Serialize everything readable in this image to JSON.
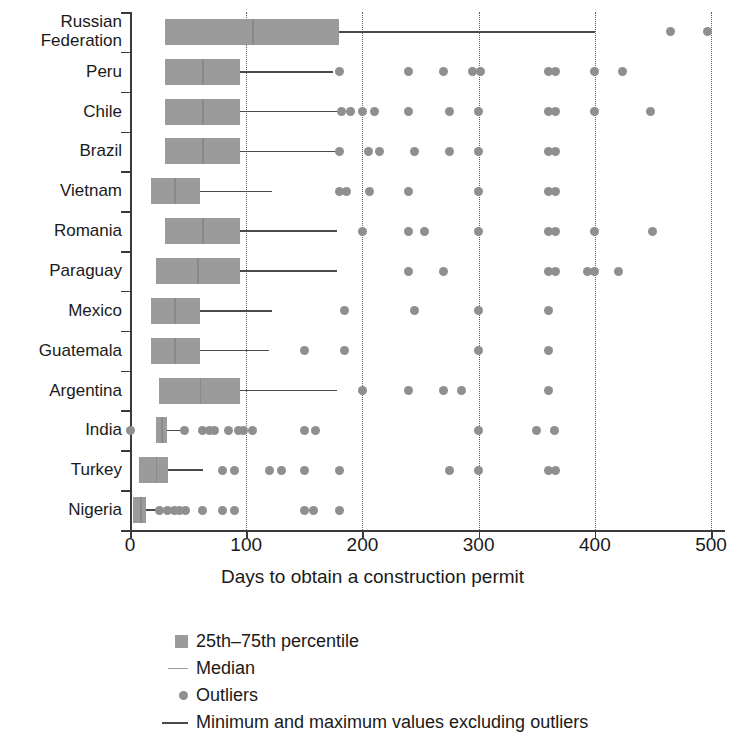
{
  "chart_data": {
    "type": "boxplot",
    "title": "",
    "xlabel": "Days to obtain a construction permit",
    "ylabel": "",
    "xlim": [
      0,
      512
    ],
    "xticks": [
      0,
      100,
      200,
      300,
      400,
      500
    ],
    "xticklabels": [
      "0",
      "100",
      "200",
      "300",
      "400",
      "500"
    ],
    "gridlines_x": [
      100,
      200,
      300,
      400,
      500
    ],
    "grid": "dotted-vertical",
    "orientation": "horizontal",
    "legend_position": "below-axis-left",
    "categories": [
      "Russian\nFederation",
      "Peru",
      "Chile",
      "Brazil",
      "Vietnam",
      "Romania",
      "Paraguay",
      "Mexico",
      "Guatemala",
      "Argentina",
      "India",
      "Turkey",
      "Nigeria"
    ],
    "boxes": [
      {
        "category": "Russian Federation",
        "min": 30,
        "q1": 30,
        "median": 105,
        "q3": 180,
        "max": 400,
        "outliers": [
          465,
          497
        ]
      },
      {
        "category": "Peru",
        "min": 30,
        "q1": 30,
        "median": 62,
        "q3": 95,
        "max": 175,
        "outliers": [
          180,
          240,
          270,
          295,
          302,
          360,
          366,
          400,
          424
        ]
      },
      {
        "category": "Chile",
        "min": 30,
        "q1": 30,
        "median": 62,
        "q3": 95,
        "max": 180,
        "outliers": [
          182,
          190,
          200,
          210,
          240,
          275,
          300,
          360,
          366,
          400,
          448
        ]
      },
      {
        "category": "Brazil",
        "min": 30,
        "q1": 30,
        "median": 62,
        "q3": 95,
        "max": 178,
        "outliers": [
          180,
          205,
          215,
          245,
          275,
          300,
          360,
          366
        ]
      },
      {
        "category": "Vietnam",
        "min": 18,
        "q1": 18,
        "median": 38,
        "q3": 60,
        "max": 122,
        "outliers": [
          180,
          186,
          206,
          240,
          300,
          360,
          366
        ]
      },
      {
        "category": "Romania",
        "min": 30,
        "q1": 30,
        "median": 62,
        "q3": 95,
        "max": 178,
        "outliers": [
          200,
          240,
          253,
          300,
          360,
          366,
          400,
          450
        ]
      },
      {
        "category": "Paraguay",
        "min": 22,
        "q1": 22,
        "median": 58,
        "q3": 95,
        "max": 178,
        "outliers": [
          240,
          270,
          360,
          366,
          394,
          400,
          420
        ]
      },
      {
        "category": "Mexico",
        "min": 18,
        "q1": 18,
        "median": 38,
        "q3": 60,
        "max": 122,
        "outliers": [
          185,
          245,
          300,
          360
        ]
      },
      {
        "category": "Guatemala",
        "min": 18,
        "q1": 18,
        "median": 38,
        "q3": 60,
        "max": 120,
        "outliers": [
          150,
          185,
          300,
          360
        ]
      },
      {
        "category": "Argentina",
        "min": 25,
        "q1": 25,
        "median": 60,
        "q3": 95,
        "max": 178,
        "outliers": [
          200,
          240,
          270,
          285,
          360
        ]
      },
      {
        "category": "India",
        "min": 22,
        "q1": 22,
        "median": 27,
        "q3": 32,
        "max": 48,
        "outliers": [
          0,
          47,
          62,
          68,
          73,
          85,
          93,
          98,
          105,
          150,
          160,
          300,
          350,
          365
        ]
      },
      {
        "category": "Turkey",
        "min": 8,
        "q1": 8,
        "median": 22,
        "q3": 33,
        "max": 63,
        "outliers": [
          80,
          90,
          120,
          130,
          150,
          180,
          275,
          300,
          360,
          366
        ]
      },
      {
        "category": "Nigeria",
        "min": 3,
        "q1": 3,
        "median": 9,
        "q3": 14,
        "max": 22,
        "outliers": [
          25,
          32,
          38,
          43,
          48,
          62,
          80,
          90,
          150,
          158,
          180
        ]
      }
    ],
    "colors": {
      "box_fill": "#9b9b9b",
      "outlier": "#8f8f8f",
      "whisker": "#4a4a4a",
      "axis": "#3a3a3a",
      "gridline": "#5a5a5a",
      "text": "#1a1a1a"
    }
  },
  "axis": {
    "x_title": "Days to obtain a construction permit",
    "tick_labels": [
      "0",
      "100",
      "200",
      "300",
      "400",
      "500"
    ]
  },
  "legend": {
    "items": [
      {
        "marker": "square-swatch-icon",
        "label": "25th–75th percentile"
      },
      {
        "marker": "short-line-icon",
        "label": "Median"
      },
      {
        "marker": "dot-icon",
        "label": "Outliers"
      },
      {
        "marker": "long-line-icon",
        "label": "Minimum and maximum values excluding outliers"
      }
    ]
  }
}
